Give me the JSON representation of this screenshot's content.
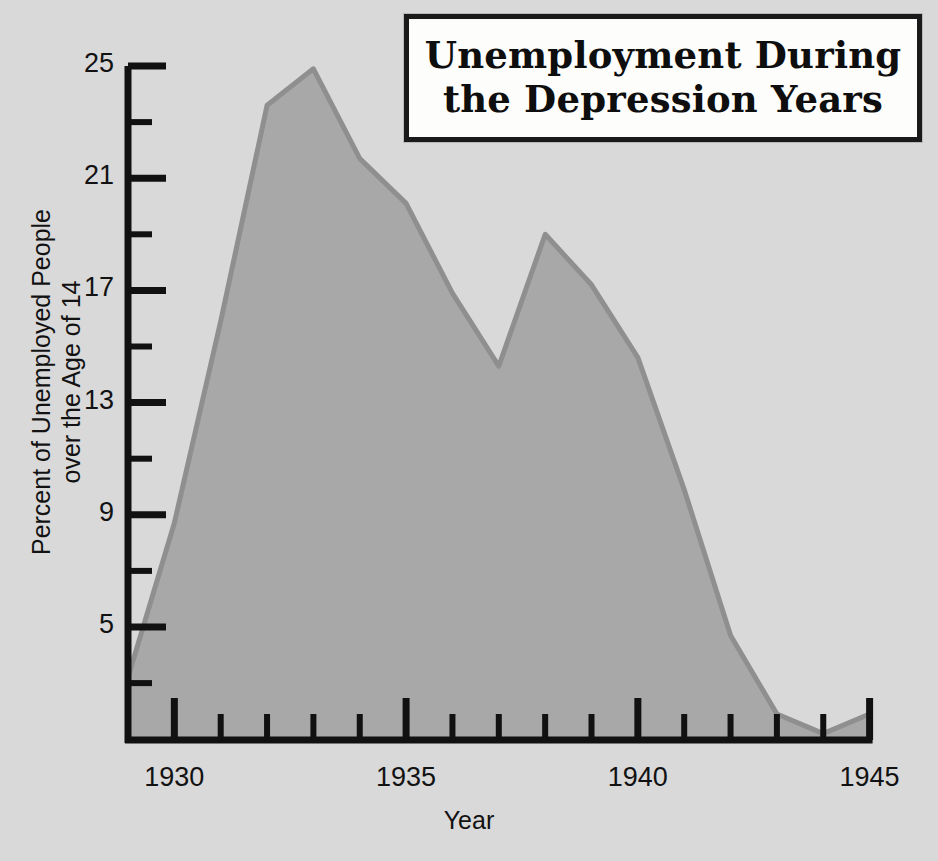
{
  "title": {
    "line1": "Unemployment During",
    "line2": "the Depression Years"
  },
  "axes": {
    "ylabel_line1": "Percent of Unemployed People",
    "ylabel_line2": "over the Age of 14",
    "xlabel": "Year"
  },
  "colors": {
    "background": "#d9d9d9",
    "area_fill": "#a8a8a8",
    "area_line": "#8f8f8f",
    "axis": "#111111",
    "title_box_fill": "#fdfdfb",
    "title_text": "#0e0e0e"
  },
  "chart_data": {
    "type": "area",
    "title": "Unemployment During the Depression Years",
    "xlabel": "Year",
    "ylabel": "Percent of Unemployed People over the Age of 14",
    "xlim": [
      1929,
      1945
    ],
    "ylim": [
      0.9,
      25
    ],
    "grid": false,
    "legend": null,
    "x_major_ticks": [
      1930,
      1935,
      1940,
      1945
    ],
    "x_major_tick_labels": [
      "1930",
      "1935",
      "1940",
      "1945"
    ],
    "x_minor_ticks": [
      1929,
      1931,
      1932,
      1933,
      1934,
      1936,
      1937,
      1938,
      1939,
      1941,
      1942,
      1943,
      1944
    ],
    "y_major_ticks": [
      5,
      9,
      13,
      17,
      21,
      25
    ],
    "y_major_tick_labels": [
      "5",
      "9",
      "13",
      "17",
      "21",
      "25"
    ],
    "y_minor_ticks": [
      3,
      7,
      11,
      15,
      19,
      23
    ],
    "x": [
      1929,
      1930,
      1931,
      1932,
      1933,
      1934,
      1935,
      1936,
      1937,
      1938,
      1939,
      1940,
      1941,
      1942,
      1943,
      1944,
      1945
    ],
    "values": [
      3.2,
      8.7,
      15.9,
      23.6,
      24.9,
      21.7,
      20.1,
      16.9,
      14.3,
      19.0,
      17.2,
      14.6,
      9.9,
      4.7,
      1.9,
      1.2,
      1.9
    ],
    "series": [
      {
        "name": "Percent unemployed",
        "values": [
          3.2,
          8.7,
          15.9,
          23.6,
          24.9,
          21.7,
          20.1,
          16.9,
          14.3,
          19.0,
          17.2,
          14.6,
          9.9,
          4.7,
          1.9,
          1.2,
          1.9
        ]
      }
    ]
  }
}
